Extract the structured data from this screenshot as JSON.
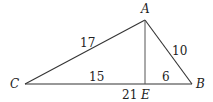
{
  "figure": {
    "type": "triangle-with-altitude",
    "points": {
      "A": {
        "label": "A",
        "x": 145,
        "y": 20
      },
      "B": {
        "label": "B",
        "x": 192,
        "y": 84
      },
      "C": {
        "label": "C",
        "x": 25,
        "y": 84
      },
      "E": {
        "label": "E",
        "x": 145,
        "y": 84
      }
    },
    "segments": [
      {
        "from": "C",
        "to": "A",
        "length_label": "17"
      },
      {
        "from": "A",
        "to": "B",
        "length_label": "10"
      },
      {
        "from": "C",
        "to": "E",
        "length_label": "15"
      },
      {
        "from": "E",
        "to": "B",
        "length_label": "6"
      },
      {
        "from": "A",
        "to": "E",
        "length_label": ""
      },
      {
        "from": "C",
        "to": "B",
        "length_label": "21"
      }
    ]
  },
  "labels": {
    "A": "A",
    "B": "B",
    "C": "C",
    "E": "E",
    "CA": "17",
    "AB": "10",
    "CE": "15",
    "EB": "6",
    "CB": "21"
  }
}
